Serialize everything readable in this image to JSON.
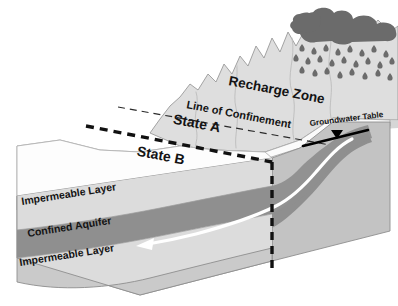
{
  "figure": {
    "type": "geologic-cross-section-block-diagram"
  },
  "labels": {
    "recharge_zone": "Recharge Zone",
    "line_of_confinement": "Line of Confinement",
    "state_a": "State A",
    "state_b": "State B",
    "groundwater_table": "Groundwater Table",
    "impermeable_layer_upper": "Impermeable Layer",
    "confined_aquifer": "Confined Aquifer",
    "impermeable_layer_lower": "Impermeable Layer"
  },
  "icons": {
    "cloud": "cloud-icon",
    "rain": "raindrops-icon",
    "water_table_marker": "water-table-triangle-icon",
    "flow_arrow": "groundwater-flow-arrow-icon"
  },
  "colors": {
    "background": "#ffffff",
    "mountain_fill": "#dedede",
    "top_surface": "#fbfbfb",
    "front_face_light": "#d2d2d2",
    "aquifer_dark": "#8f8f8f",
    "right_face": "#c3c3c3",
    "cloud_dark": "#6b6b6b",
    "raindrop": "#6b6b6b",
    "text": "#141414",
    "outline": "#6e6e6e",
    "dashed_heavy": "#111111",
    "flow_arrow": "#ffffff",
    "water_table_line": "#000000"
  }
}
